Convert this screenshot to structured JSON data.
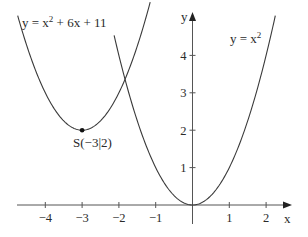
{
  "chart_data": {
    "type": "line",
    "title": "",
    "xlabel": "x",
    "ylabel": "y",
    "xlim": [
      -4.8,
      2.65
    ],
    "ylim": [
      -0.5,
      5.2
    ],
    "grid": false,
    "x_ticks": [
      -4,
      -3,
      -2,
      -1,
      1,
      2
    ],
    "x_tick_labels": [
      "−4",
      "−3",
      "−2",
      "−1",
      "1",
      "2"
    ],
    "y_ticks": [
      1,
      2,
      3,
      4
    ],
    "y_tick_labels": [
      "1",
      "2",
      "3",
      "4"
    ],
    "series": [
      {
        "name": "y = x² + 6x + 11",
        "formula": "x^2 + 6x + 11",
        "x_range": [
          -4.75,
          -1.15
        ],
        "x": [
          -4.75,
          -4.5,
          -4,
          -3.5,
          -3,
          -2.5,
          -2,
          -1.5,
          -1.15
        ],
        "y": [
          5.06,
          4.25,
          3,
          2.25,
          2,
          2.25,
          3,
          4.25,
          5.42
        ]
      },
      {
        "name": "y = x²",
        "formula": "x^2",
        "x_range": [
          -2.13,
          2.25
        ],
        "x": [
          -2.13,
          -2,
          -1.5,
          -1,
          -0.5,
          0,
          0.5,
          1,
          1.5,
          2,
          2.25
        ],
        "y": [
          4.54,
          4,
          2.25,
          1,
          0.25,
          0,
          0.25,
          1,
          2.25,
          4,
          5.06
        ]
      }
    ],
    "annotations": [
      {
        "text": "S(−3|2)",
        "point": [
          -3,
          2
        ],
        "marker": "dot"
      }
    ]
  },
  "labels": {
    "curve_left_prefix": "y = x",
    "curve_left_exp": "2",
    "curve_left_suffix": " + 6x + 11",
    "curve_right_prefix": "y = x",
    "curve_right_exp": "2",
    "vertex": "S(−3|2)",
    "x_axis": "x",
    "y_axis": "y"
  },
  "colors": {
    "curve": "#3a3a3a",
    "axis": "#555555",
    "text": "#2a2a2a"
  }
}
